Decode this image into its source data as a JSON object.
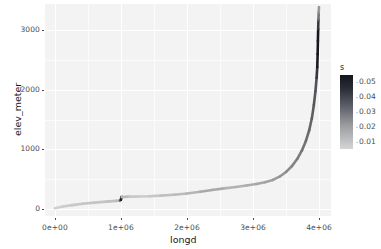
{
  "chart_data": {
    "type": "line",
    "title": "",
    "subtitle": "",
    "xlabel": "longd",
    "ylabel": "elev_meter",
    "xlim": [
      -150000,
      4180000
    ],
    "ylim": [
      -120,
      3440
    ],
    "grid": true,
    "legend": {
      "title": "s",
      "position": "right",
      "type": "continuous-colorbar",
      "labels": [
        "0.05",
        "0.04",
        "0.03",
        "0.02",
        "0.01"
      ],
      "values": [
        0.05,
        0.04,
        0.03,
        0.02,
        0.01
      ],
      "gradient_low_color": "#d5d5d5",
      "gradient_high_color": "#14161c"
    },
    "xticks": [
      {
        "value": 0,
        "label": "0e+00"
      },
      {
        "value": 1000000,
        "label": "1e+06"
      },
      {
        "value": 2000000,
        "label": "2e+06"
      },
      {
        "value": 3000000,
        "label": "3e+06"
      },
      {
        "value": 4000000,
        "label": "4e+06"
      }
    ],
    "yticks": [
      {
        "value": 0,
        "label": "0"
      },
      {
        "value": 1000,
        "label": "1000"
      },
      {
        "value": 2000,
        "label": "2000"
      },
      {
        "value": 3000,
        "label": "3000"
      }
    ],
    "xminor": [
      500000,
      1500000,
      2500000,
      3500000
    ],
    "yminor": [
      500,
      1500,
      2500
    ],
    "series": [
      {
        "name": "elev_meter",
        "color_variable": "s",
        "points": [
          {
            "x": 0,
            "y": 10,
            "s": 0.004
          },
          {
            "x": 120000,
            "y": 40,
            "s": 0.005
          },
          {
            "x": 260000,
            "y": 62,
            "s": 0.005
          },
          {
            "x": 420000,
            "y": 85,
            "s": 0.006
          },
          {
            "x": 600000,
            "y": 105,
            "s": 0.006
          },
          {
            "x": 780000,
            "y": 122,
            "s": 0.006
          },
          {
            "x": 930000,
            "y": 134,
            "s": 0.007
          },
          {
            "x": 985000,
            "y": 140,
            "s": 0.008
          },
          {
            "x": 1000000,
            "y": 152,
            "s": 0.05
          },
          {
            "x": 1005000,
            "y": 196,
            "s": 0.05
          },
          {
            "x": 1015000,
            "y": 200,
            "s": 0.01
          },
          {
            "x": 1120000,
            "y": 205,
            "s": 0.006
          },
          {
            "x": 1280000,
            "y": 208,
            "s": 0.005
          },
          {
            "x": 1430000,
            "y": 212,
            "s": 0.005
          },
          {
            "x": 1600000,
            "y": 222,
            "s": 0.006
          },
          {
            "x": 1800000,
            "y": 238,
            "s": 0.007
          },
          {
            "x": 2000000,
            "y": 258,
            "s": 0.008
          },
          {
            "x": 2200000,
            "y": 286,
            "s": 0.009
          },
          {
            "x": 2380000,
            "y": 318,
            "s": 0.013
          },
          {
            "x": 2560000,
            "y": 344,
            "s": 0.009
          },
          {
            "x": 2740000,
            "y": 368,
            "s": 0.009
          },
          {
            "x": 2900000,
            "y": 392,
            "s": 0.01
          },
          {
            "x": 3050000,
            "y": 418,
            "s": 0.011
          },
          {
            "x": 3180000,
            "y": 448,
            "s": 0.012
          },
          {
            "x": 3300000,
            "y": 486,
            "s": 0.013
          },
          {
            "x": 3400000,
            "y": 540,
            "s": 0.015
          },
          {
            "x": 3500000,
            "y": 620,
            "s": 0.017
          },
          {
            "x": 3590000,
            "y": 720,
            "s": 0.019
          },
          {
            "x": 3670000,
            "y": 840,
            "s": 0.021
          },
          {
            "x": 3740000,
            "y": 980,
            "s": 0.023
          },
          {
            "x": 3800000,
            "y": 1140,
            "s": 0.025
          },
          {
            "x": 3850000,
            "y": 1320,
            "s": 0.027
          },
          {
            "x": 3890000,
            "y": 1520,
            "s": 0.029
          },
          {
            "x": 3920000,
            "y": 1740,
            "s": 0.031
          },
          {
            "x": 3945000,
            "y": 1980,
            "s": 0.033
          },
          {
            "x": 3962000,
            "y": 2200,
            "s": 0.034
          },
          {
            "x": 3972000,
            "y": 2380,
            "s": 0.05
          },
          {
            "x": 3978000,
            "y": 2600,
            "s": 0.052
          },
          {
            "x": 3982000,
            "y": 2820,
            "s": 0.053
          },
          {
            "x": 3986000,
            "y": 3020,
            "s": 0.052
          },
          {
            "x": 3990000,
            "y": 3180,
            "s": 0.03
          },
          {
            "x": 3994000,
            "y": 3300,
            "s": 0.018
          },
          {
            "x": 3998000,
            "y": 3390,
            "s": 0.012
          }
        ]
      }
    ]
  }
}
